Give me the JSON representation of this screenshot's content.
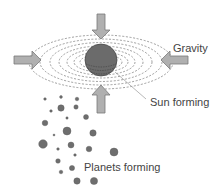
{
  "labels": {
    "gravity": "Gravity",
    "sun_forming": "Sun forming",
    "planets_forming": "Planets forming"
  },
  "colors": {
    "background": "#ffffff",
    "sun_fill": "#6b6b6b",
    "sun_stroke": "#4a4a4a",
    "orbit_stroke": "#777777",
    "arrow_fill": "#b0b0b0",
    "arrow_stroke": "#7a7a7a",
    "planet_fill": "#6e6e6e",
    "text": "#444444",
    "leader_line": "#9a9a9a"
  },
  "icons": {
    "arrow_top": "arrow-down-icon",
    "arrow_bottom": "arrow-up-icon",
    "arrow_left": "arrow-right-icon",
    "arrow_right": "arrow-left-icon"
  }
}
